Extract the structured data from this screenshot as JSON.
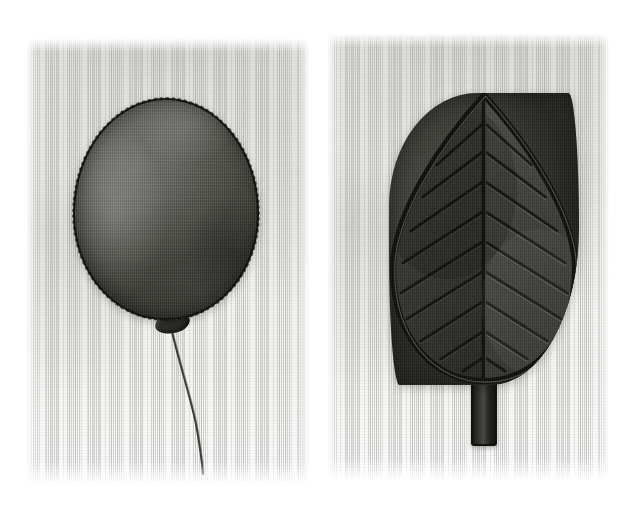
{
  "image": {
    "kind": "photograph",
    "subject": "two fabric appliqué panels photographed side by side",
    "background_color": "#ffffff",
    "palette": {
      "paper_white": "#ffffff",
      "cloth_white": "#f3f3f1",
      "cloth_shadow": "#b8b8b4",
      "balloon_gray": "#5b5b56",
      "balloon_highlight": "#6f6f6b",
      "balloon_outline": "#161614",
      "leaf_dark": "#3a3a35",
      "leaf_deep": "#242420",
      "leaf_outline": "#101010",
      "stem_gray": "#4a4a44",
      "string_dark": "#2b2b27"
    }
  },
  "panels": [
    {
      "id": "panel-balloon",
      "label": "Balloon appliqué panel",
      "frame": {
        "x": 27,
        "y": 39,
        "w": 282,
        "h": 445
      },
      "subject_label": "balloon",
      "elements": {
        "balloon_body": {
          "label": "balloon body",
          "x": 73,
          "y": 98,
          "w": 186,
          "h": 222
        },
        "balloon_knot": {
          "label": "balloon knot",
          "x": 155,
          "y": 313,
          "w": 35,
          "h": 20
        },
        "balloon_string": {
          "label": "balloon string",
          "path": "M 172 332 C 182 372, 190 396, 196 424 C 200 446, 202 462, 203 474"
        },
        "cast_shadow": {
          "label": "balloon cast shadow",
          "x": 62,
          "y": 112,
          "w": 212,
          "h": 226
        }
      }
    },
    {
      "id": "panel-leaf",
      "label": "Leaf appliqué panel",
      "frame": {
        "x": 328,
        "y": 34,
        "w": 281,
        "h": 446
      },
      "subject_label": "leaf",
      "elements": {
        "leaf_blade": {
          "label": "leaf blade",
          "x": 389,
          "y": 93,
          "w": 190,
          "h": 292
        },
        "leaf_midrib": {
          "label": "leaf midrib vein",
          "x": 482,
          "y": 95,
          "w": 4,
          "h": 292
        },
        "leaf_stem": {
          "label": "leaf stem",
          "x": 471,
          "y": 378,
          "w": 26,
          "h": 68
        },
        "vein_pairs": 9,
        "vein_angle_degrees": 36,
        "cast_shadow": {
          "label": "leaf cast shadow",
          "x": 375,
          "y": 110,
          "w": 215,
          "h": 300
        }
      }
    }
  ]
}
